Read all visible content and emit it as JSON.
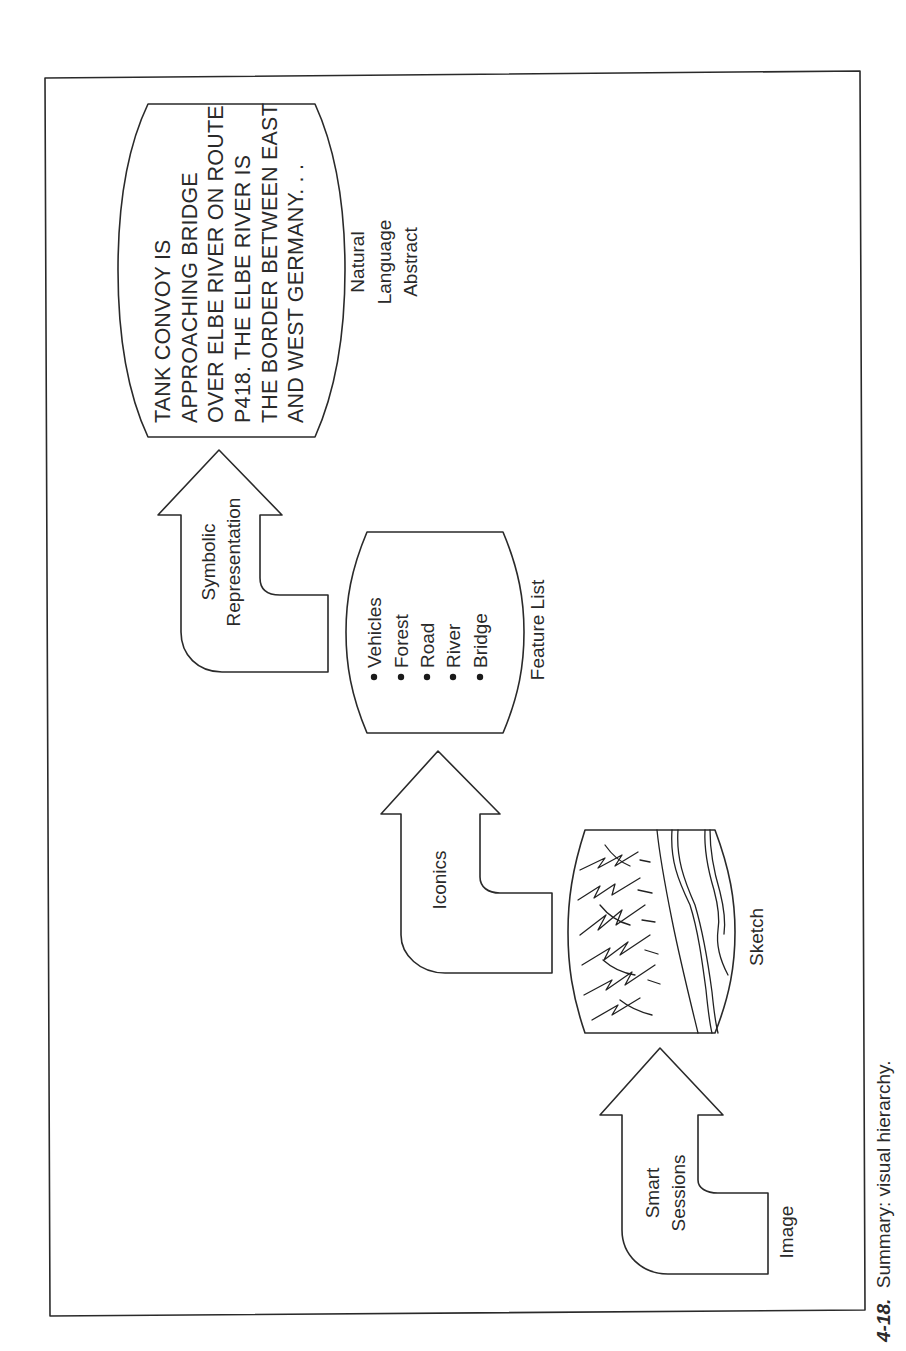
{
  "figure": {
    "caption_number": "4-18.",
    "caption_text": "Summary: visual hierarchy."
  },
  "levels": [
    {
      "id": "image",
      "label": "Image"
    },
    {
      "id": "sketch",
      "label": "Sketch"
    },
    {
      "id": "feature_list",
      "label": "Feature List",
      "items": [
        "Vehicles",
        "Forest",
        "Road",
        "River",
        "Bridge"
      ]
    },
    {
      "id": "natural_language",
      "label_lines": [
        "Natural",
        "Language",
        "Abstract"
      ],
      "abstract_lines": [
        "TANK CONVOY IS",
        "APPROACHING BRIDGE",
        "OVER ELBE RIVER ON ROUTE",
        "P418. THE ELBE RIVER IS",
        "THE BORDER BETWEEN EAST",
        "AND WEST GERMANY. . ."
      ]
    }
  ],
  "arrows": [
    {
      "id": "smart_sessions",
      "label_lines": [
        "Smart",
        "Sessions"
      ]
    },
    {
      "id": "iconics",
      "label_lines": [
        "Iconics"
      ]
    },
    {
      "id": "symbolic",
      "label_lines": [
        "Symbolic",
        "Representation"
      ]
    }
  ]
}
